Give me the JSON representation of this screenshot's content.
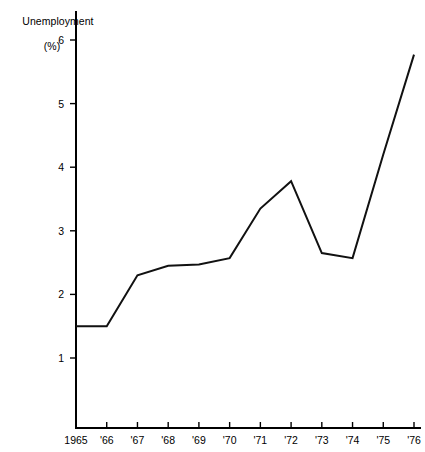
{
  "chart_data": {
    "type": "line",
    "title": "Unemployment",
    "subtitle": "(%)",
    "xlabel": "",
    "ylabel": "Unemployment (%)",
    "categories": [
      "1965",
      "'66",
      "'67",
      "'68",
      "'69",
      "'70",
      "'71",
      "'72",
      "'73",
      "'74",
      "'75",
      "'76"
    ],
    "x": [
      1965,
      1966,
      1967,
      1968,
      1969,
      1970,
      1971,
      1972,
      1973,
      1974,
      1975,
      1976
    ],
    "values": [
      1.5,
      1.5,
      2.3,
      2.45,
      2.47,
      2.57,
      3.35,
      3.78,
      2.65,
      2.57,
      4.2,
      5.77
    ],
    "series": [
      {
        "name": "Unemployment",
        "values": [
          1.5,
          1.5,
          2.3,
          2.45,
          2.47,
          2.57,
          3.35,
          3.78,
          2.65,
          2.57,
          4.2,
          5.77
        ]
      }
    ],
    "ylim": [
      0.5,
      6.3
    ],
    "xlim": [
      1965,
      1976
    ],
    "yticks": [
      1,
      2,
      3,
      4,
      5,
      6
    ],
    "ytick_labels": [
      "1",
      "2",
      "3",
      "4",
      "5",
      "6"
    ],
    "xtick_labels": [
      "1965",
      "'66",
      "'67",
      "'68",
      "'69",
      "'70",
      "'71",
      "'72",
      "'73",
      "'74",
      "'75",
      "'76"
    ],
    "grid": false,
    "legend": "none",
    "line_color": "#111111",
    "background_color": "#ffffff"
  },
  "axis": {
    "y_title_line1": "Unemployment",
    "y_title_line2": "(%)"
  }
}
